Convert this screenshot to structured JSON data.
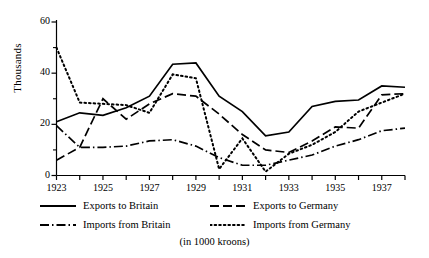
{
  "chart_data": {
    "type": "line",
    "title": "",
    "subtitle": "",
    "caption": "(in 1000 kroons)",
    "xlabel": "",
    "ylabel": "Thousands",
    "units_note": "in 1000 kroons",
    "grid": false,
    "legend_position": "below-plot",
    "xlim": [
      1923,
      1938
    ],
    "ylim": [
      0,
      60
    ],
    "ytick_values": [
      0,
      20,
      40,
      60
    ],
    "ytick_labels": [
      "0",
      "20",
      "40",
      "60"
    ],
    "yminor_values": [
      10,
      30,
      50
    ],
    "xtick_values": [
      1923,
      1924,
      1925,
      1926,
      1927,
      1928,
      1929,
      1930,
      1931,
      1932,
      1933,
      1934,
      1935,
      1936,
      1937,
      1938
    ],
    "xtick_labels": [
      "1923",
      "",
      "1925",
      "",
      "1927",
      "",
      "1929",
      "",
      "1931",
      "",
      "1933",
      "",
      "1935",
      "",
      "1937",
      ""
    ],
    "x": [
      1923,
      1924,
      1925,
      1926,
      1927,
      1928,
      1929,
      1930,
      1931,
      1932,
      1933,
      1934,
      1935,
      1936,
      1937,
      1938
    ],
    "series": [
      {
        "name": "Exports to Britain",
        "style": "solid",
        "color": "#000000",
        "values": [
          21,
          24.5,
          23.5,
          26.5,
          31,
          43.5,
          44,
          31,
          25,
          15.5,
          17,
          27,
          29,
          29.5,
          35,
          34.5
        ]
      },
      {
        "name": "Imports from Britain",
        "style": "dashdot",
        "color": "#000000",
        "values": [
          19.5,
          11,
          11,
          11.5,
          13.5,
          14,
          11.5,
          7,
          4,
          4,
          6,
          8,
          11.5,
          14,
          17.5,
          18.5
        ]
      },
      {
        "name": "Exports to Germany",
        "style": "dashed",
        "color": "#000000",
        "values": [
          6,
          11,
          30,
          22,
          28,
          32,
          31,
          24,
          16,
          10,
          9,
          13.5,
          19,
          18.5,
          31.5,
          32
        ]
      },
      {
        "name": "Imports from Germany",
        "style": "dotted",
        "color": "#000000",
        "values": [
          50,
          28.5,
          28,
          27.5,
          24.5,
          39.5,
          38,
          2.5,
          14.5,
          1.5,
          8.5,
          12,
          17,
          25,
          28.5,
          32
        ]
      }
    ]
  },
  "legend": {
    "entries": [
      {
        "label": "Exports to Britain",
        "style": "solid"
      },
      {
        "label": "Exports to Germany",
        "style": "dashed"
      },
      {
        "label": "Imports from Britain",
        "style": "dashdot"
      },
      {
        "label": "Imports from Germany",
        "style": "dotted"
      }
    ]
  },
  "axes": {
    "y_title": "Thousands"
  },
  "caption": {
    "text": "(in 1000 kroons)"
  }
}
